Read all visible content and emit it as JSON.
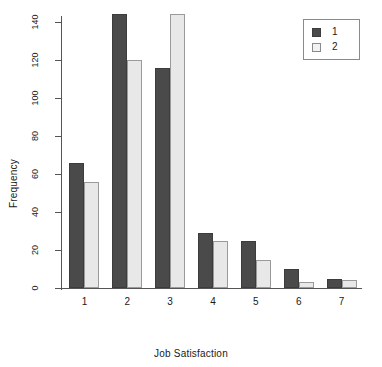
{
  "chart_data": {
    "type": "bar",
    "title": "",
    "subtitle": "",
    "xlabel": "Job Satisfaction",
    "ylabel": "Frequency",
    "categories": [
      "1",
      "2",
      "3",
      "4",
      "5",
      "6",
      "7"
    ],
    "series": [
      {
        "name": "1",
        "color": "#4a4a4a",
        "values": [
          66,
          144,
          116,
          29,
          25,
          10,
          5
        ]
      },
      {
        "name": "2",
        "color": "#e8e8e8",
        "values": [
          56,
          120,
          144,
          25,
          15,
          3,
          4
        ]
      }
    ],
    "ylim": [
      0,
      140
    ],
    "yticks": [
      0,
      20,
      40,
      60,
      80,
      100,
      120,
      140
    ],
    "ytick_labels": [
      "0",
      "20",
      "40",
      "60",
      "80",
      "100",
      "120",
      "140"
    ],
    "grid": false,
    "legend": {
      "position": "top-right",
      "entries": [
        "1",
        "2"
      ]
    }
  }
}
